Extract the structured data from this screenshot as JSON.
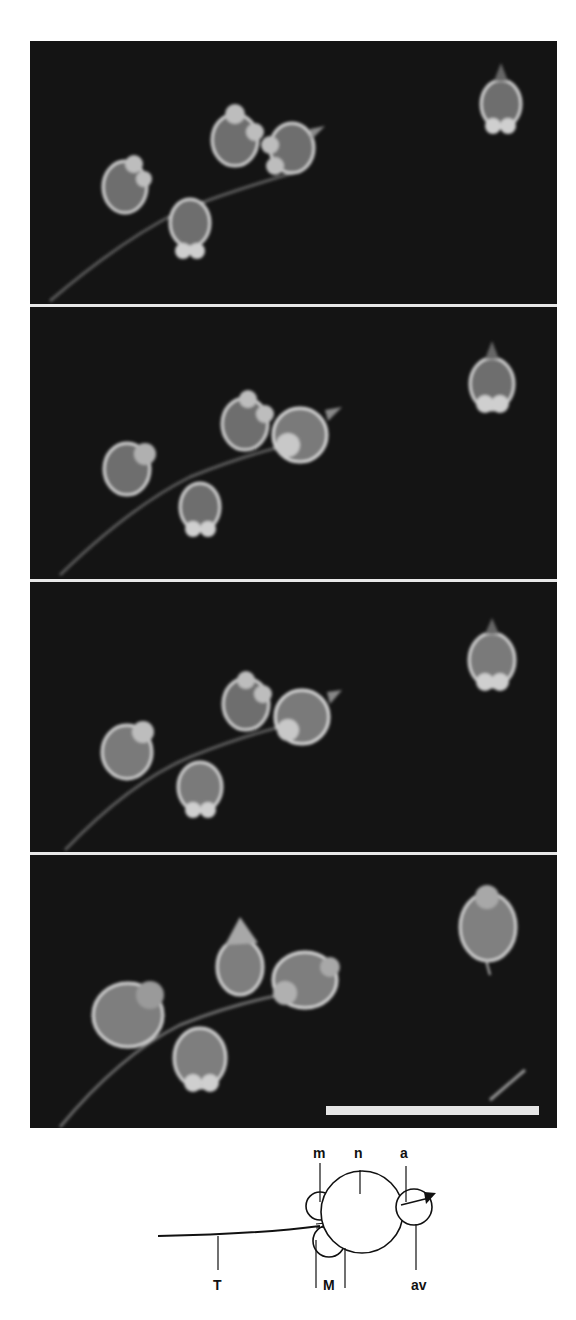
{
  "figure": {
    "panels": [
      {
        "index": 1,
        "description": "time-lapse frame 1"
      },
      {
        "index": 2,
        "description": "time-lapse frame 2"
      },
      {
        "index": 3,
        "description": "time-lapse frame 3"
      },
      {
        "index": 4,
        "description": "time-lapse frame 4"
      }
    ],
    "colors": {
      "background": "#141414",
      "separator": "#e8e8e8",
      "cell_fill": "#7a7a7a",
      "cell_edge": "#d8d8d8",
      "scale_bar": "#e6e6e6"
    },
    "scale_bar": {
      "label": ""
    }
  },
  "schematic": {
    "labels": {
      "m": "m",
      "n": "n",
      "a": "a",
      "T": "T",
      "M": "M",
      "av": "av"
    }
  }
}
